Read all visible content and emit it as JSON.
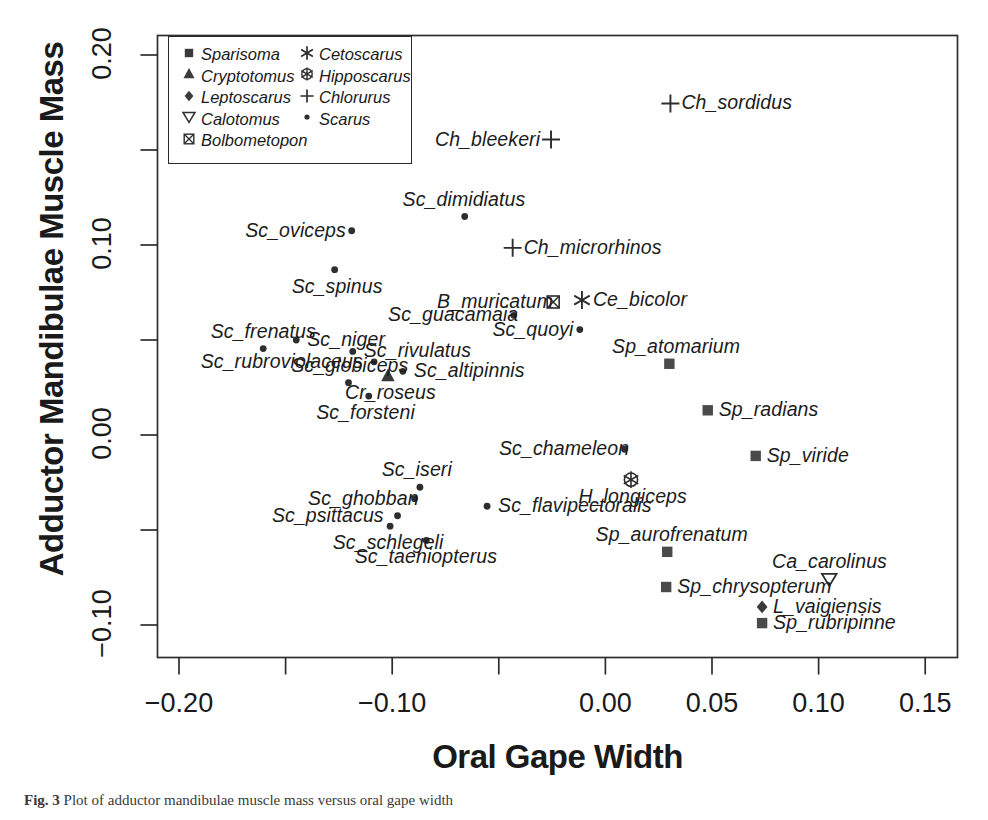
{
  "figure": {
    "caption_prefix": "Fig. 3",
    "caption_text": "Plot of adductor mandibulae muscle mass versus oral gape width"
  },
  "chart_data": {
    "type": "scatter",
    "title": "",
    "xlabel": "Oral Gape Width",
    "ylabel": "Adductor Mandibulae Muscle Mass",
    "xlim": [
      -0.225,
      0.16
    ],
    "ylim": [
      -0.115,
      0.215
    ],
    "xticks": [
      -0.2,
      -0.15,
      -0.1,
      -0.05,
      0.0,
      0.05,
      0.1,
      0.15
    ],
    "xticklabels": [
      "-0.20",
      "",
      "-0.10",
      "",
      "0.00",
      "0.05",
      "0.10",
      "0.15"
    ],
    "yticks": [
      -0.1,
      -0.05,
      0.0,
      0.05,
      0.1,
      0.15,
      0.2
    ],
    "yticklabels": [
      "-0.10",
      "",
      "0.00",
      "",
      "0.10",
      "",
      "0.20"
    ],
    "grid": false,
    "legend_position": "top-left-inside",
    "legend": [
      {
        "genus": "Sparisoma",
        "symbol": "filled-square"
      },
      {
        "genus": "Cryptotomus",
        "symbol": "filled-triangle-up"
      },
      {
        "genus": "Leptoscarus",
        "symbol": "filled-diamond"
      },
      {
        "genus": "Calotomus",
        "symbol": "open-triangle-down"
      },
      {
        "genus": "Bolbometopon",
        "symbol": "crossed-square"
      },
      {
        "genus": "Cetoscarus",
        "symbol": "asterisk"
      },
      {
        "genus": "Hipposcarus",
        "symbol": "crossed-circle"
      },
      {
        "genus": "Chlorurus",
        "symbol": "plus"
      },
      {
        "genus": "Scarus",
        "symbol": "small-dot"
      }
    ],
    "series": [
      {
        "name": "Chlorurus",
        "symbol": "plus",
        "points": [
          {
            "label": "Ch_sordidus",
            "x": 0.0305,
            "y": 0.1745,
            "label_pos": "right"
          },
          {
            "label": "Ch_bleekeri",
            "x": -0.0255,
            "y": 0.1555,
            "label_pos": "left"
          },
          {
            "label": "Ch_microrhinos",
            "x": -0.0435,
            "y": 0.0985,
            "label_pos": "right"
          }
        ]
      },
      {
        "name": "Scarus",
        "symbol": "small-dot",
        "points": [
          {
            "label": "Sc_dimidiatus",
            "x": -0.066,
            "y": 0.115,
            "label_pos": "above"
          },
          {
            "label": "Sc_oviceps",
            "x": -0.119,
            "y": 0.1075,
            "label_pos": "left"
          },
          {
            "label": "Sc_spinus",
            "x": -0.127,
            "y": 0.087,
            "label_pos": "below"
          },
          {
            "label": "Sc_guacamaia",
            "x": -0.043,
            "y": 0.063,
            "label_pos": "left"
          },
          {
            "label": "Sc_quoyi",
            "x": -0.012,
            "y": 0.0555,
            "label_pos": "left"
          },
          {
            "label": "Sc_frenatus",
            "x": -0.1605,
            "y": 0.0455,
            "label_pos": "above"
          },
          {
            "label": "Sc_niger",
            "x": -0.145,
            "y": 0.05,
            "label_pos": "right"
          },
          {
            "label": "Sc_rivulatus",
            "x": -0.1185,
            "y": 0.044,
            "label_pos": "right"
          },
          {
            "label": "Sc_rubroviolaceus",
            "x": -0.1085,
            "y": 0.0385,
            "label_pos": "left"
          },
          {
            "label": "Sc_altipinnis",
            "x": -0.095,
            "y": 0.0335,
            "label_pos": "right"
          },
          {
            "label": "Sc_globiceps",
            "x": -0.1205,
            "y": 0.0275,
            "label_pos": "above"
          },
          {
            "label": "Sc_forsteni",
            "x": -0.111,
            "y": 0.0205,
            "label_pos": "below"
          },
          {
            "label": "Sc_chameleon",
            "x": 0.009,
            "y": -0.0075,
            "label_pos": "left"
          },
          {
            "label": "Sc_iseri",
            "x": -0.087,
            "y": -0.0275,
            "label_pos": "above"
          },
          {
            "label": "Sc_ghobban",
            "x": -0.0895,
            "y": -0.0335,
            "label_pos": "left"
          },
          {
            "label": "Sc_flavipectoralis",
            "x": -0.0555,
            "y": -0.0375,
            "label_pos": "right"
          },
          {
            "label": "Sc_psittacus",
            "x": -0.0975,
            "y": -0.0425,
            "label_pos": "left"
          },
          {
            "label": "Sc_schlegeli",
            "x": -0.101,
            "y": -0.048,
            "label_pos": "below"
          },
          {
            "label": "Sc_taeniopterus",
            "x": -0.084,
            "y": -0.0555,
            "label_pos": "below"
          }
        ]
      },
      {
        "name": "Bolbometopon",
        "symbol": "crossed-square",
        "points": [
          {
            "label": "B_muricatum",
            "x": -0.0245,
            "y": 0.07,
            "label_pos": "left"
          }
        ]
      },
      {
        "name": "Cetoscarus",
        "symbol": "asterisk",
        "points": [
          {
            "label": "Ce_bicolor",
            "x": -0.011,
            "y": 0.071,
            "label_pos": "right"
          }
        ]
      },
      {
        "name": "Cryptotomus",
        "symbol": "filled-triangle-up",
        "points": [
          {
            "label": "Cr_roseus",
            "x": -0.102,
            "y": 0.031,
            "label_pos": "below"
          }
        ]
      },
      {
        "name": "Hipposcarus",
        "symbol": "crossed-circle",
        "points": [
          {
            "label": "H_longiceps",
            "x": 0.012,
            "y": -0.0235,
            "label_pos": "below"
          }
        ]
      },
      {
        "name": "Sparisoma",
        "symbol": "filled-square",
        "points": [
          {
            "label": "Sp_atomarium",
            "x": 0.03,
            "y": 0.0375,
            "label_pos": "above"
          },
          {
            "label": "Sp_radians",
            "x": 0.048,
            "y": 0.013,
            "label_pos": "right"
          },
          {
            "label": "Sp_viride",
            "x": 0.0705,
            "y": -0.011,
            "label_pos": "right"
          },
          {
            "label": "Sp_aurofrenatum",
            "x": 0.029,
            "y": -0.0615,
            "label_pos": "above"
          },
          {
            "label": "Sp_chrysopterum",
            "x": 0.0285,
            "y": -0.08,
            "label_pos": "right"
          },
          {
            "label": "Sp_rubripinne",
            "x": 0.0735,
            "y": -0.099,
            "label_pos": "right"
          }
        ]
      },
      {
        "name": "Calotomus",
        "symbol": "open-triangle-down",
        "points": [
          {
            "label": "Ca_carolinus",
            "x": 0.105,
            "y": -0.076,
            "label_pos": "above"
          }
        ]
      },
      {
        "name": "Leptoscarus",
        "symbol": "filled-diamond",
        "points": [
          {
            "label": "L_vaigiensis",
            "x": 0.0735,
            "y": -0.0905,
            "label_pos": "right"
          }
        ]
      }
    ]
  }
}
